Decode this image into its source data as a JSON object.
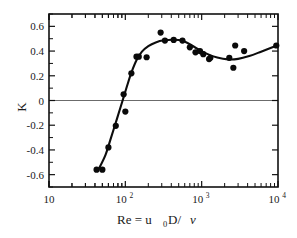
{
  "figure": {
    "background_color": "#ffffff",
    "ink_color": "#0d0d0d",
    "zeroline_color": "#6b6b6b"
  },
  "axes": {
    "y_title": "K",
    "x_title_parts": {
      "lead": "Re = u",
      "sub": "0",
      "mid": "D/ ",
      "nu": "ν"
    },
    "x_title_plain": "Re = u0D/ ν",
    "y_ticks": [
      "0.6",
      "0.4",
      "0.2",
      "0",
      "-0.2",
      "-0.4",
      "-0.6"
    ],
    "y_tick_values": [
      0.6,
      0.4,
      0.2,
      0,
      -0.2,
      -0.4,
      -0.6
    ],
    "x_ticks": [
      {
        "mantissa": "10",
        "exponent": ""
      },
      {
        "mantissa": "10",
        "exponent": "2"
      },
      {
        "mantissa": "10",
        "exponent": "3"
      },
      {
        "mantissa": "10",
        "exponent": "4"
      }
    ],
    "x_tick_values": [
      10,
      100,
      1000,
      10000
    ]
  },
  "chart_data": {
    "type": "scatter",
    "title": "",
    "subtitle": "",
    "xlabel": "Re = u0D/ ν",
    "ylabel": "K",
    "xscale": "log",
    "yscale": "linear",
    "xlim": [
      10,
      10000
    ],
    "ylim": [
      -0.7,
      0.7
    ],
    "grid": false,
    "legend": null,
    "annotations": [
      {
        "text": "horizontal reference line at K = 0",
        "y": 0
      }
    ],
    "series": [
      {
        "name": "measured K",
        "marker": "filled-circle",
        "color": "#0a0a0a",
        "points": [
          {
            "x": 42,
            "y": -0.56
          },
          {
            "x": 50,
            "y": -0.56
          },
          {
            "x": 60,
            "y": -0.38
          },
          {
            "x": 75,
            "y": -0.205
          },
          {
            "x": 95,
            "y": 0.05
          },
          {
            "x": 100,
            "y": -0.09
          },
          {
            "x": 120,
            "y": 0.22
          },
          {
            "x": 140,
            "y": 0.355
          },
          {
            "x": 150,
            "y": 0.355
          },
          {
            "x": 190,
            "y": 0.35
          },
          {
            "x": 290,
            "y": 0.55
          },
          {
            "x": 330,
            "y": 0.485
          },
          {
            "x": 430,
            "y": 0.49
          },
          {
            "x": 560,
            "y": 0.485
          },
          {
            "x": 700,
            "y": 0.43
          },
          {
            "x": 830,
            "y": 0.39
          },
          {
            "x": 950,
            "y": 0.4
          },
          {
            "x": 1050,
            "y": 0.375
          },
          {
            "x": 1250,
            "y": 0.335
          },
          {
            "x": 1300,
            "y": 0.345
          },
          {
            "x": 2300,
            "y": 0.345
          },
          {
            "x": 2600,
            "y": 0.265
          },
          {
            "x": 2750,
            "y": 0.445
          },
          {
            "x": 3600,
            "y": 0.4
          },
          {
            "x": 9500,
            "y": 0.445
          }
        ]
      },
      {
        "name": "fitted curve",
        "marker": "none",
        "line": "solid",
        "color": "#0d0d0d",
        "points": [
          {
            "x": 44,
            "y": -0.565
          },
          {
            "x": 55,
            "y": -0.44
          },
          {
            "x": 65,
            "y": -0.3
          },
          {
            "x": 78,
            "y": -0.145
          },
          {
            "x": 90,
            "y": -0.02
          },
          {
            "x": 105,
            "y": 0.115
          },
          {
            "x": 120,
            "y": 0.225
          },
          {
            "x": 140,
            "y": 0.325
          },
          {
            "x": 165,
            "y": 0.395
          },
          {
            "x": 200,
            "y": 0.44
          },
          {
            "x": 250,
            "y": 0.47
          },
          {
            "x": 320,
            "y": 0.487
          },
          {
            "x": 430,
            "y": 0.492
          },
          {
            "x": 560,
            "y": 0.483
          },
          {
            "x": 700,
            "y": 0.455
          },
          {
            "x": 900,
            "y": 0.415
          },
          {
            "x": 1200,
            "y": 0.375
          },
          {
            "x": 1600,
            "y": 0.348
          },
          {
            "x": 2200,
            "y": 0.333
          },
          {
            "x": 3000,
            "y": 0.337
          },
          {
            "x": 4200,
            "y": 0.36
          },
          {
            "x": 6000,
            "y": 0.395
          },
          {
            "x": 9700,
            "y": 0.445
          }
        ]
      }
    ]
  }
}
